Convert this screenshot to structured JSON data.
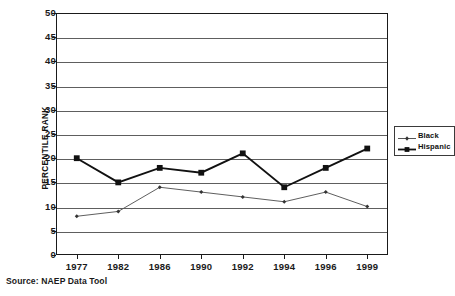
{
  "chart_data": {
    "type": "line",
    "title": "",
    "subtitle": "",
    "xlabel": "",
    "ylabel": "PERCENTILE RANK",
    "categories": [
      "1977",
      "1982",
      "1986",
      "1990",
      "1992",
      "1994",
      "1996",
      "1999"
    ],
    "ylim": [
      0,
      50
    ],
    "ytick_step": 5,
    "yticks": [
      "50",
      "45",
      "40",
      "35",
      "30",
      "25",
      "20",
      "15",
      "10",
      "5",
      "0"
    ],
    "grid": true,
    "legend_position": "right",
    "series": [
      {
        "name": "Black",
        "values": [
          8,
          9,
          14,
          13,
          12,
          11,
          13,
          10
        ],
        "color": "#555555",
        "marker": "small-diamond",
        "line_width": "thin"
      },
      {
        "name": "Hispanic",
        "values": [
          20,
          15,
          18,
          17,
          21,
          14,
          18,
          22
        ],
        "color": "#111111",
        "marker": "large-square",
        "line_width": "thick"
      }
    ]
  },
  "legend": {
    "entries": [
      {
        "label": "Black"
      },
      {
        "label": "Hispanic"
      }
    ]
  },
  "footer": {
    "source": "Source: NAEP Data Tool"
  },
  "colors": {
    "axis": "#1a1a1a",
    "gridline": "#5e5e5e",
    "series_black": "#555555",
    "series_hispanic": "#111111",
    "background": "#ffffff"
  }
}
